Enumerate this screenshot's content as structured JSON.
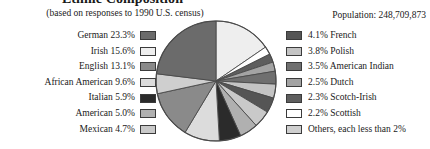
{
  "header": {
    "title": "Ethnic Composition",
    "subtitle": "(based on responses to 1990 U.S. census)",
    "population": "Population: 248,709,873"
  },
  "legend_left": [
    {
      "label": "German 23.3%",
      "color": "#6b6b6b"
    },
    {
      "label": "Irish 15.6%",
      "color": "#eeeeee"
    },
    {
      "label": "English 13.1%",
      "color": "#8a8a8a"
    },
    {
      "label": "African American 9.6%",
      "color": "#dcdcdc"
    },
    {
      "label": "Italian 5.9%",
      "color": "#2b2b2b"
    },
    {
      "label": "American 5.0%",
      "color": "#b0b0b0"
    },
    {
      "label": "Mexican 4.7%",
      "color": "#c9c9c9"
    }
  ],
  "legend_right": [
    {
      "label": "4.1% French",
      "color": "#555555"
    },
    {
      "label": "3.8% Polish",
      "color": "#c4c4c4"
    },
    {
      "label": "3.5% American Indian",
      "color": "#6f6f6f"
    },
    {
      "label": "2.5% Dutch",
      "color": "#a3a3a3"
    },
    {
      "label": "2.3% Scotch-Irish",
      "color": "#5e5e5e"
    },
    {
      "label": "2.2% Scottish",
      "color": "#ffffff"
    },
    {
      "label": "Others, each less than 2%",
      "color": "#cfcfcf"
    }
  ],
  "chart_data": {
    "type": "pie",
    "title": "Ethnic Composition",
    "subtitle": "(based on responses to 1990 U.S. census)",
    "annotation": "Population: 248,709,873",
    "legend_position": "left and right of pie",
    "start_angle_deg": 0,
    "direction": "clockwise",
    "unit": "percent",
    "categories": [
      "Irish",
      "Scottish",
      "Scotch-Irish",
      "Dutch",
      "American Indian",
      "Polish",
      "French",
      "Mexican",
      "American",
      "Italian",
      "African American",
      "English",
      "Others, each less than 2%",
      "German"
    ],
    "values": [
      15.6,
      2.2,
      2.3,
      2.5,
      3.5,
      3.8,
      4.1,
      4.7,
      5.0,
      5.9,
      9.6,
      13.1,
      5.4,
      23.3
    ],
    "colors": [
      "#eeeeee",
      "#ffffff",
      "#5e5e5e",
      "#a3a3a3",
      "#6f6f6f",
      "#c4c4c4",
      "#555555",
      "#c9c9c9",
      "#b0b0b0",
      "#2b2b2b",
      "#dcdcdc",
      "#8a8a8a",
      "#cfcfcf",
      "#6b6b6b"
    ],
    "center": [
      61,
      61
    ],
    "radius": 60,
    "stroke": "#4a4a4a"
  }
}
